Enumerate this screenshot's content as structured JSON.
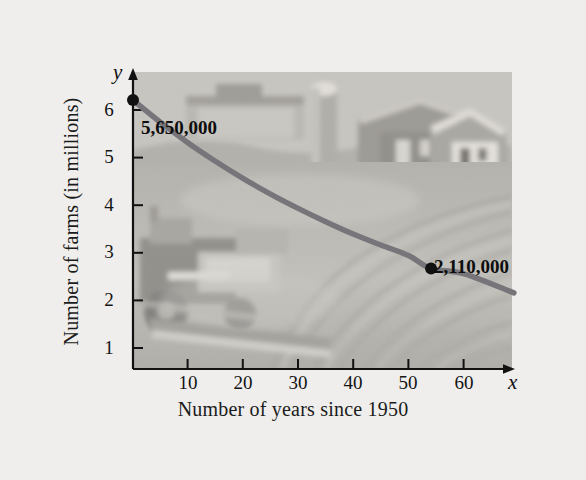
{
  "figure": {
    "background_color": "#efeeec",
    "photo": {
      "alt_name": "farm-field-photograph",
      "description": "grayscale photograph of a farm: combine harvester at left, barn and silo at upper right, plowed field rows",
      "tone_light": "#d8d6d1",
      "tone_mid": "#b9b7b2",
      "tone_dark": "#8d8b87"
    }
  },
  "chart_data": {
    "type": "line",
    "title": "",
    "subtitle": "",
    "xlabel": "Number of years since 1950",
    "ylabel": "Number of farms (in millions)",
    "xlim": [
      0,
      69
    ],
    "ylim": [
      0,
      6.6
    ],
    "xticks": [
      10,
      20,
      30,
      40,
      50,
      60
    ],
    "yticks": [
      1,
      2,
      3,
      4,
      5,
      6
    ],
    "xtick_labels": [
      "10",
      "20",
      "30",
      "40",
      "50",
      "60"
    ],
    "ytick_labels": [
      "1",
      "2",
      "3",
      "4",
      "5",
      "6"
    ],
    "grid": false,
    "legend": null,
    "x_axis_symbol": "x",
    "y_axis_symbol": "y",
    "series": [
      {
        "name": "Number of farms",
        "curve_color": "#77757a",
        "x": [
          0,
          5,
          10,
          15,
          20,
          25,
          30,
          35,
          40,
          45,
          50,
          54,
          60,
          69
        ],
        "y": [
          5.65,
          5.18,
          4.75,
          4.36,
          4.0,
          3.67,
          3.37,
          3.09,
          2.83,
          2.6,
          2.38,
          2.11,
          2.0,
          1.6
        ]
      }
    ],
    "annotations": [
      {
        "name": "point-1950",
        "label": "5,650,000",
        "x": 0,
        "y": 5.65,
        "marker": "filled-circle",
        "marker_color": "#111111"
      },
      {
        "name": "point-2004",
        "label": "2,110,000",
        "x": 54,
        "y": 2.11,
        "marker": "filled-circle",
        "marker_color": "#111111"
      }
    ]
  }
}
